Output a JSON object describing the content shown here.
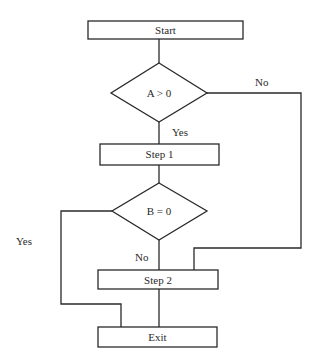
{
  "diagram": {
    "type": "flowchart",
    "nodes": [
      {
        "id": "start",
        "shape": "process",
        "label": "Start"
      },
      {
        "id": "decision_a",
        "shape": "decision",
        "label": "A > 0"
      },
      {
        "id": "step1",
        "shape": "process",
        "label": "Step 1"
      },
      {
        "id": "decision_b",
        "shape": "decision",
        "label": "B = 0"
      },
      {
        "id": "step2",
        "shape": "process",
        "label": "Step 2"
      },
      {
        "id": "exit",
        "shape": "process",
        "label": "Exit"
      }
    ],
    "edges": [
      {
        "from": "start",
        "to": "decision_a",
        "label": ""
      },
      {
        "from": "decision_a",
        "to": "step1",
        "label": "Yes"
      },
      {
        "from": "decision_a",
        "to": "step2",
        "label": "No"
      },
      {
        "from": "step1",
        "to": "decision_b",
        "label": ""
      },
      {
        "from": "decision_b",
        "to": "step2",
        "label": "No"
      },
      {
        "from": "decision_b",
        "to": "exit",
        "label": "Yes"
      },
      {
        "from": "step2",
        "to": "exit",
        "label": ""
      }
    ]
  },
  "labels": {
    "start": "Start",
    "decision_a": "A > 0",
    "step1": "Step 1",
    "decision_b": "B = 0",
    "step2": "Step 2",
    "exit": "Exit",
    "a_yes": "Yes",
    "a_no": "No",
    "b_yes": "Yes",
    "b_no": "No"
  },
  "colors": {
    "stroke": "#2a2a2a",
    "background": "#ffffff"
  }
}
